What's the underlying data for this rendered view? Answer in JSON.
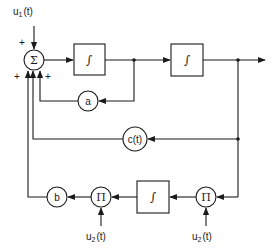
{
  "diagram": {
    "type": "block-diagram",
    "inputs": {
      "u1": "u",
      "u1_sub": "1",
      "u1_arg": "(t)",
      "u2_left": "u",
      "u2_left_sub": "2",
      "u2_left_arg": "(t)",
      "u2_right": "u",
      "u2_right_sub": "2",
      "u2_right_arg": "(t)"
    },
    "summer": {
      "symbol": "Σ",
      "signs": {
        "top": "+",
        "left": "+",
        "right": "+"
      }
    },
    "integrators": {
      "first": "∫",
      "second": "∫",
      "bottom": "∫"
    },
    "gains": {
      "a": "a",
      "c": "c(t)",
      "b": "b"
    },
    "multipliers": {
      "left": "Π",
      "right": "Π"
    },
    "colors": {
      "stroke": "#1a1a1a",
      "background": "#ffffff"
    }
  }
}
